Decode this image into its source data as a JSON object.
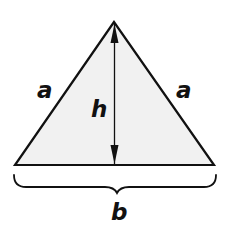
{
  "diagram": {
    "colors": {
      "fill": "#f1f1f1",
      "stroke": "#111111",
      "background": "#ffffff"
    },
    "labels": {
      "left_side": "a",
      "right_side": "a",
      "height": "h",
      "base": "b"
    }
  }
}
